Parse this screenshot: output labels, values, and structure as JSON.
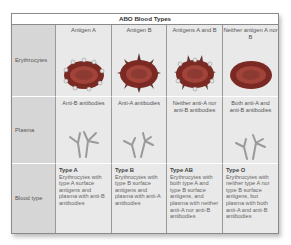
{
  "table": {
    "title": "ABO Blood Types",
    "row_labels": [
      "Erythrocytes",
      "Plasma",
      "Blood type"
    ],
    "columns": [
      {
        "header": "Antigen A",
        "erythrocyte_icon": "red-cell-with-round-antigens",
        "plasma_text": "Anti-B antibodies",
        "plasma_icon": "antibody-icon",
        "type_name": "Type A",
        "type_description": "Erythrocytes with type A surface antigens and plasma with anti-B antibodies"
      },
      {
        "header": "Antigen B",
        "erythrocyte_icon": "red-cell-with-spike-antigens",
        "plasma_text": "Anti-A antibodies",
        "plasma_icon": "antibody-icon",
        "type_name": "Type B",
        "type_description": "Erythrocytes with type B surface antigens and plasma with anti-A antibodies"
      },
      {
        "header": "Antigens A and B",
        "erythrocyte_icon": "red-cell-with-both-antigens",
        "plasma_text": "Neither anti-A nor anti-B antibodies",
        "plasma_icon": null,
        "type_name": "Type AB",
        "type_description": "Erythrocytes with both type A and type B surface antigens, and plasma with neither anti-A nor anti-B antibodies"
      },
      {
        "header": "Neither antigen A nor B",
        "erythrocyte_icon": "red-cell-no-antigens",
        "plasma_text": "Both anti-A and anti-B antibodies",
        "plasma_icon": "antibody-icon",
        "type_name": "Type O",
        "type_description": "Erythrocytes with neither type A nor type B surface antigens, but plasma with both anti-A and anti-B antibodies"
      }
    ],
    "colors": {
      "cell_rim": "#7a2a22",
      "cell_center": "#a2433a",
      "antigen_a": "#e6e6e6",
      "antigen_b": "#5a3530",
      "antibody": "#9a9a9a"
    }
  }
}
